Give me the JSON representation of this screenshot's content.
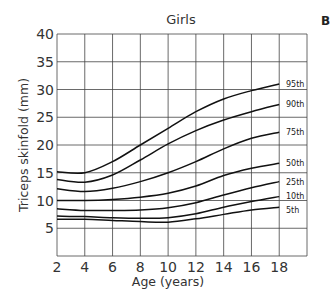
{
  "panel_label": "B",
  "chart_data": {
    "type": "line",
    "title": "Girls",
    "xlabel": "Age (years)",
    "ylabel": "Triceps skinfold (mm)",
    "xlim": [
      2,
      20
    ],
    "ylim": [
      0,
      40
    ],
    "x_ticks": [
      2,
      4,
      6,
      8,
      10,
      12,
      14,
      16,
      18
    ],
    "y_ticks": [
      5,
      10,
      15,
      20,
      25,
      30,
      35,
      40
    ],
    "grid": true,
    "legend_position": "inline-right",
    "x": [
      2,
      4,
      6,
      8,
      10,
      12,
      14,
      16,
      18
    ],
    "series": [
      {
        "name": "95th",
        "values": [
          15.2,
          15.0,
          17.0,
          20.0,
          23.0,
          26.0,
          28.3,
          29.8,
          31.0
        ]
      },
      {
        "name": "90th",
        "values": [
          13.8,
          13.3,
          14.6,
          17.3,
          20.2,
          22.6,
          24.5,
          26.0,
          27.3
        ]
      },
      {
        "name": "75th",
        "values": [
          12.1,
          11.6,
          12.2,
          13.4,
          15.0,
          17.0,
          19.3,
          21.2,
          22.3
        ]
      },
      {
        "name": "50th",
        "values": [
          10.0,
          10.0,
          10.2,
          10.6,
          11.3,
          12.6,
          14.5,
          15.8,
          16.7
        ]
      },
      {
        "name": "25th",
        "values": [
          8.5,
          8.2,
          8.2,
          8.3,
          8.7,
          9.6,
          11.0,
          12.3,
          13.4
        ]
      },
      {
        "name": "10th",
        "values": [
          7.2,
          7.1,
          6.9,
          6.8,
          6.9,
          7.6,
          8.8,
          9.8,
          10.7
        ]
      },
      {
        "name": "5th",
        "values": [
          6.6,
          6.6,
          6.4,
          6.2,
          6.1,
          6.7,
          7.5,
          8.3,
          8.8
        ]
      }
    ]
  }
}
